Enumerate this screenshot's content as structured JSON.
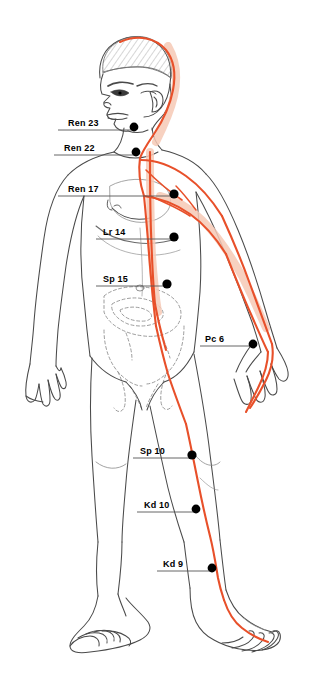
{
  "figure": {
    "background_color": "#ffffff",
    "outline_color": "#4a4a4a",
    "meridian_color": "#e8502a",
    "meridian_band_color": "#f6c9b6",
    "point_color": "#000000",
    "leader_color": "#555555"
  },
  "points": [
    {
      "id": "ren-23",
      "label": "Ren 23",
      "dot": {
        "x": 134,
        "y": 127
      },
      "label_pos": {
        "x": 68,
        "y": 118
      },
      "leader": {
        "x1": 58,
        "x2": 132,
        "y": 130
      }
    },
    {
      "id": "ren-22",
      "label": "Ren 22",
      "dot": {
        "x": 136,
        "y": 152
      },
      "label_pos": {
        "x": 64,
        "y": 143
      },
      "leader": {
        "x1": 54,
        "x2": 134,
        "y": 155
      }
    },
    {
      "id": "ren-17",
      "label": "Ren 17",
      "dot": {
        "x": 174,
        "y": 194
      },
      "label_pos": {
        "x": 68,
        "y": 184
      },
      "leader": {
        "x1": 58,
        "x2": 172,
        "y": 196
      }
    },
    {
      "id": "lr-14",
      "label": "Lr 14",
      "dot": {
        "x": 174,
        "y": 237
      },
      "label_pos": {
        "x": 103,
        "y": 227
      },
      "leader": {
        "x1": 96,
        "x2": 172,
        "y": 239
      }
    },
    {
      "id": "sp-15",
      "label": "Sp 15",
      "dot": {
        "x": 167,
        "y": 284
      },
      "label_pos": {
        "x": 103,
        "y": 274
      },
      "leader": {
        "x1": 96,
        "x2": 165,
        "y": 286
      }
    },
    {
      "id": "pc-6",
      "label": "Pc 6",
      "dot": {
        "x": 253,
        "y": 344
      },
      "label_pos": {
        "x": 205,
        "y": 334
      },
      "leader": {
        "x1": 200,
        "x2": 251,
        "y": 346
      }
    },
    {
      "id": "sp-10",
      "label": "Sp 10",
      "dot": {
        "x": 192,
        "y": 455
      },
      "label_pos": {
        "x": 140,
        "y": 446
      },
      "leader": {
        "x1": 133,
        "x2": 190,
        "y": 458
      }
    },
    {
      "id": "kd-10",
      "label": "Kd 10",
      "dot": {
        "x": 196,
        "y": 509
      },
      "label_pos": {
        "x": 144,
        "y": 500
      },
      "leader": {
        "x1": 137,
        "x2": 194,
        "y": 512
      }
    },
    {
      "id": "kd-9",
      "label": "Kd 9",
      "dot": {
        "x": 212,
        "y": 568
      },
      "label_pos": {
        "x": 163,
        "y": 559
      },
      "leader": {
        "x1": 157,
        "x2": 210,
        "y": 571
      }
    }
  ]
}
